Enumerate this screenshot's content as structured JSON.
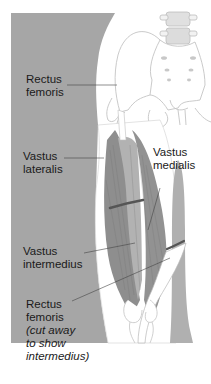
{
  "figure": {
    "colors": {
      "background": "#ffffff",
      "skin_panel": "#a6a6a6",
      "muscle_dark": "#8a8a8a",
      "muscle_mid": "#9b9b9b",
      "muscle_light": "#b5b5b5",
      "bone_outline": "#bdbdbd",
      "cut_band": "#555555",
      "leader_line": "#444444"
    },
    "labels": {
      "rectus_femoris_top": "Rectus\nfemoris",
      "vastus_lateralis": "Vastus\nlateralis",
      "vastus_medialis": "Vastus\nmedialis",
      "vastus_intermedius": "Vastus\nintermedius",
      "rectus_femoris_bottom": "Rectus\nfemoris",
      "rectus_femoris_note": "(cut away\nto show\nintermedius)"
    }
  }
}
